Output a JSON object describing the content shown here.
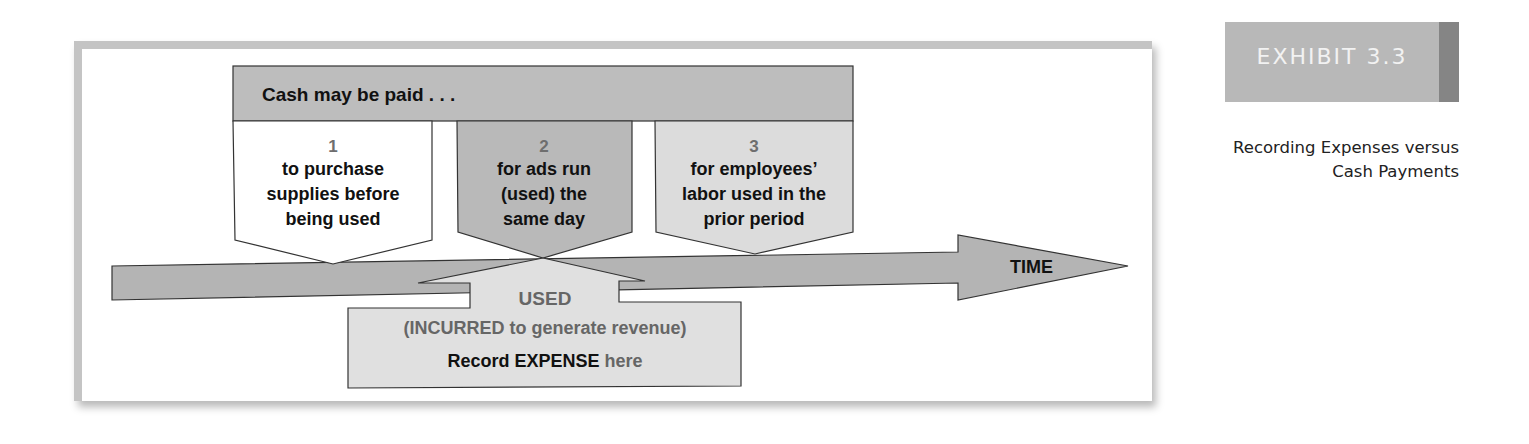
{
  "exhibit": {
    "label": "EXHIBIT 3.3",
    "caption_line1": "Recording Expenses versus",
    "caption_line2": "Cash Payments"
  },
  "diagram": {
    "header": "Cash may be paid . . .",
    "boxes": [
      {
        "number": "1",
        "lines": [
          "to purchase",
          "supplies before",
          "being used"
        ],
        "fill": "#ffffff"
      },
      {
        "number": "2",
        "lines": [
          "for ads run",
          "(used) the",
          "same day"
        ],
        "fill": "#b9b9b9"
      },
      {
        "number": "3",
        "lines": [
          "for employees’",
          "labor used in the",
          "prior period"
        ],
        "fill": "#dcdcdc"
      }
    ],
    "timeline_label": "TIME",
    "used_box": {
      "title": "USED",
      "subtitle": "(INCURRED to generate revenue)",
      "record_bold": "Record EXPENSE",
      "record_rest": " here"
    }
  },
  "colors": {
    "header_fill": "#bdbdbd",
    "arrow_fill": "#b4b4b4",
    "used_fill": "#e0e0e0",
    "number_color": "#6e6e6e",
    "exhibit_fill": "#b8b8b8",
    "exhibit_strip": "#858585"
  }
}
